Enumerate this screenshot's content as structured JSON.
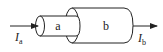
{
  "diagram": {
    "type": "coaxial-cylinders",
    "segments": [
      {
        "id": "a",
        "label": "a"
      },
      {
        "id": "b",
        "label": "b"
      }
    ],
    "currents": {
      "input": {
        "symbol": "I",
        "subscript": "a"
      },
      "output": {
        "symbol": "I",
        "subscript": "b"
      }
    },
    "colors": {
      "stroke": "#222222",
      "fill": "#ffffff"
    }
  }
}
